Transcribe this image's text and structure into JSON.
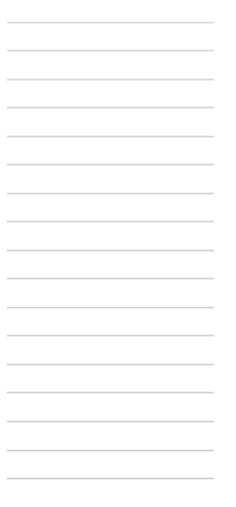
{
  "page": {
    "kind": "ruled-note-page",
    "width_px": 236,
    "height_px": 507,
    "background_color": "#ffffff",
    "content_text": "",
    "alt_description": "Blank lined notepad page with horizontal ruled lines"
  },
  "rules": {
    "count": 17,
    "line_color": "#d4d4d6",
    "line_thickness_px": 1,
    "spacing_px": 28.5,
    "first_line_y_px": 22,
    "last_line_y_px": 478,
    "left_inset_px": 7,
    "right_edge_px": 214,
    "lines": [
      {
        "index": 1,
        "y_px": 22,
        "x_start_px": 7,
        "x_end_px": 214,
        "color": "#dcdcde"
      },
      {
        "index": 2,
        "y_px": 50,
        "x_start_px": 7,
        "x_end_px": 214,
        "color": "#dadadc"
      },
      {
        "index": 3,
        "y_px": 79,
        "x_start_px": 7,
        "x_end_px": 214,
        "color": "#d8d8da"
      },
      {
        "index": 4,
        "y_px": 107,
        "x_start_px": 7,
        "x_end_px": 214,
        "color": "#d6d6d8"
      },
      {
        "index": 5,
        "y_px": 136,
        "x_start_px": 7,
        "x_end_px": 214,
        "color": "#d6d6d8"
      },
      {
        "index": 6,
        "y_px": 164,
        "x_start_px": 7,
        "x_end_px": 214,
        "color": "#d5d5d7"
      },
      {
        "index": 7,
        "y_px": 193,
        "x_start_px": 7,
        "x_end_px": 214,
        "color": "#d4d4d6"
      },
      {
        "index": 8,
        "y_px": 221,
        "x_start_px": 7,
        "x_end_px": 214,
        "color": "#d4d4d6"
      },
      {
        "index": 9,
        "y_px": 250,
        "x_start_px": 7,
        "x_end_px": 214,
        "color": "#d3d3d5"
      },
      {
        "index": 10,
        "y_px": 278,
        "x_start_px": 7,
        "x_end_px": 214,
        "color": "#d3d3d5"
      },
      {
        "index": 11,
        "y_px": 307,
        "x_start_px": 7,
        "x_end_px": 214,
        "color": "#d2d2d4"
      },
      {
        "index": 12,
        "y_px": 335,
        "x_start_px": 7,
        "x_end_px": 214,
        "color": "#d1d1d3"
      },
      {
        "index": 13,
        "y_px": 364,
        "x_start_px": 7,
        "x_end_px": 214,
        "color": "#d0d0d2"
      },
      {
        "index": 14,
        "y_px": 392,
        "x_start_px": 7,
        "x_end_px": 214,
        "color": "#cfcfd1"
      },
      {
        "index": 15,
        "y_px": 421,
        "x_start_px": 7,
        "x_end_px": 214,
        "color": "#cecece"
      },
      {
        "index": 16,
        "y_px": 450,
        "x_start_px": 7,
        "x_end_px": 214,
        "color": "#cdcdcf"
      },
      {
        "index": 17,
        "y_px": 478,
        "x_start_px": 7,
        "x_end_px": 214,
        "color": "#cbcbcd"
      }
    ]
  }
}
